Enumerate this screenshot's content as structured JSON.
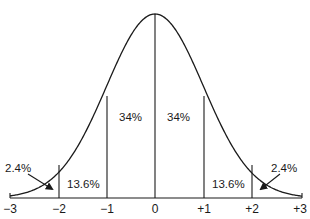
{
  "diagram": {
    "type": "normal-distribution",
    "axis": {
      "ticks": [
        "−3",
        "−2",
        "−1",
        "0",
        "+1",
        "+2",
        "+3"
      ],
      "tick_values": [
        -3,
        -2,
        -1,
        0,
        1,
        2,
        3
      ]
    },
    "regions": [
      {
        "id": "left-tail",
        "range": [
          -3,
          -2
        ],
        "label": "2.4%"
      },
      {
        "id": "left-outer",
        "range": [
          -2,
          -1
        ],
        "label": "13.6%"
      },
      {
        "id": "left-inner",
        "range": [
          -1,
          0
        ],
        "label": "34%"
      },
      {
        "id": "right-inner",
        "range": [
          0,
          1
        ],
        "label": "34%"
      },
      {
        "id": "right-outer",
        "range": [
          1,
          2
        ],
        "label": "13.6%"
      },
      {
        "id": "right-tail",
        "range": [
          2,
          3
        ],
        "label": "2.4%"
      }
    ],
    "colors": {
      "line": "#1a1a1a",
      "background": "#ffffff"
    }
  }
}
